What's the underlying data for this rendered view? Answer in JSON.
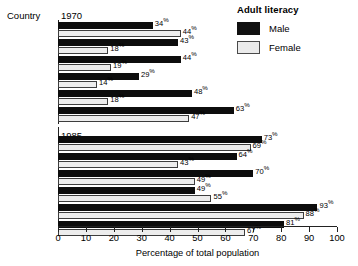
{
  "chart_data": {
    "type": "bar",
    "orientation": "horizontal",
    "title": "Adult literacy",
    "xlabel": "Percentage of total population",
    "ylabel": "Country",
    "xlim": [
      0,
      100
    ],
    "xticks": [
      0,
      10,
      20,
      30,
      40,
      50,
      60,
      70,
      80,
      90,
      100
    ],
    "grid": false,
    "legend_position": "top-right",
    "legend_title": "Adult literacy",
    "series_names": [
      "Male",
      "Female"
    ],
    "series_colors": {
      "Male": "#0d0d0d",
      "Female": "#ededed"
    },
    "categories": [
      "Botswana",
      "Ghana",
      "Kenya",
      "Mozambique",
      "Tanzania",
      "Zimbabwe"
    ],
    "panels": [
      {
        "year": "1970",
        "categories": [
          "Botswana",
          "Ghana",
          "Kenya",
          "Mozambique",
          "Tanzania",
          "Zimbabwe"
        ],
        "series": [
          {
            "name": "Male",
            "values": [
              34,
              43,
              44,
              29,
              48,
              63
            ]
          },
          {
            "name": "Female",
            "values": [
              44,
              18,
              19,
              14,
              18,
              47
            ]
          }
        ]
      },
      {
        "year": "1985",
        "categories": [
          "Botswana",
          "Ghana",
          "Kenya",
          "Mozambique",
          "Tanzania",
          "Zimbabwe"
        ],
        "series": [
          {
            "name": "Male",
            "values": [
              73,
              64,
              70,
              49,
              93,
              81
            ]
          },
          {
            "name": "Female",
            "values": [
              69,
              43,
              49,
              55,
              88,
              67
            ]
          }
        ]
      }
    ]
  },
  "header": {
    "country_label": "Country",
    "year_1970": "1970",
    "year_1985": "1985"
  },
  "legend": {
    "title": "Adult literacy",
    "items": [
      {
        "label": "Male",
        "swatch": "male-swatch-icon"
      },
      {
        "label": "Female",
        "swatch": "female-swatch-icon"
      }
    ]
  },
  "axis": {
    "title": "Percentage of total population",
    "ticks": [
      "0",
      "10",
      "20",
      "30",
      "40",
      "50",
      "60",
      "70",
      "80",
      "90",
      "100"
    ]
  },
  "value_labels": {
    "p1970": {
      "Botswana": {
        "male": "34%",
        "female": "44%"
      },
      "Ghana": {
        "male": "43%",
        "female": "18%"
      },
      "Kenya": {
        "male": "44%",
        "female": "19%"
      },
      "Mozambique": {
        "male": "29%",
        "female": "14%"
      },
      "Tanzania": {
        "male": "48%",
        "female": "18%"
      },
      "Zimbabwe": {
        "male": "63%",
        "female": "47%"
      }
    },
    "p1985": {
      "Botswana": {
        "male": "73%",
        "female": "69%"
      },
      "Ghana": {
        "male": "64%",
        "female": "43%"
      },
      "Kenya": {
        "male": "70%",
        "female": "49%"
      },
      "Mozambique": {
        "male": "49%",
        "female": "55%"
      },
      "Tanzania": {
        "male": "93%",
        "female": "88%"
      },
      "Zimbabwe": {
        "male": "81%",
        "female": "67%"
      }
    }
  }
}
